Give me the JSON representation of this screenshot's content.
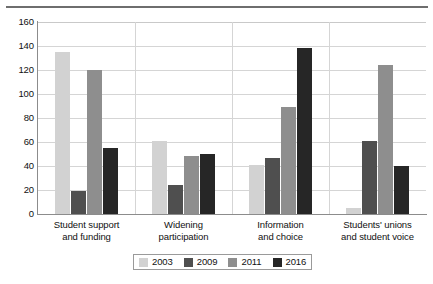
{
  "chart_data": {
    "type": "bar",
    "title": "",
    "subtitle": "",
    "xlabel": "",
    "ylabel": "",
    "ylim": [
      0,
      160
    ],
    "ytick_step": 20,
    "yticks": [
      0,
      20,
      40,
      60,
      80,
      100,
      120,
      140,
      160
    ],
    "grid": true,
    "legend_position": "bottom-center",
    "categories": [
      "Student support\nand funding",
      "Widening\nparticipation",
      "Information\nand choice",
      "Students' unions\nand student voice"
    ],
    "category_lines": [
      [
        "Student support",
        "and funding"
      ],
      [
        "Widening",
        "participation"
      ],
      [
        "Information",
        "and choice"
      ],
      [
        "Students' unions",
        "and student voice"
      ]
    ],
    "series": [
      {
        "name": "2003",
        "color": "#d2d2d2",
        "values": [
          135,
          61,
          41,
          5
        ]
      },
      {
        "name": "2009",
        "color": "#4f4f4f",
        "values": [
          19,
          24,
          47,
          61
        ]
      },
      {
        "name": "2011",
        "color": "#8e8e8e",
        "values": [
          120,
          48,
          89,
          124
        ]
      },
      {
        "name": "2016",
        "color": "#262626",
        "values": [
          55,
          50,
          138,
          40
        ]
      }
    ]
  },
  "legend": {
    "entries": [
      {
        "label": "2003",
        "color": "#d2d2d2"
      },
      {
        "label": "2009",
        "color": "#4f4f4f"
      },
      {
        "label": "2011",
        "color": "#8e8e8e"
      },
      {
        "label": "2016",
        "color": "#262626"
      }
    ]
  }
}
